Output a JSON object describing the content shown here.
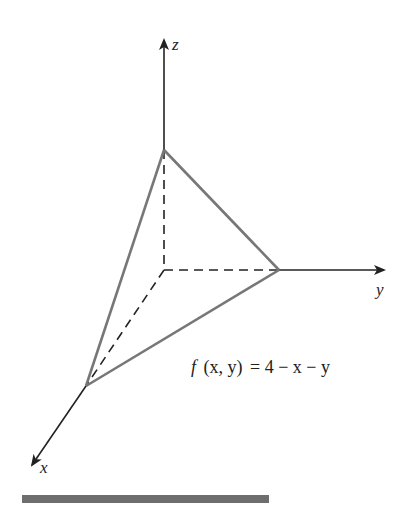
{
  "diagram": {
    "type": "3d-plane-octant",
    "axes": {
      "x_label": "x",
      "y_label": "y",
      "z_label": "z"
    },
    "formula": {
      "f": "f",
      "args": "(x, y)",
      "equals": "= 4 − x − y",
      "full": "f(x, y) = 4 − x − y"
    },
    "vertices": {
      "origin": [
        164,
        270
      ],
      "z_intercept": [
        164,
        150
      ],
      "y_intercept": [
        279,
        270
      ],
      "x_intercept": [
        86,
        386
      ]
    },
    "colors": {
      "axis": "#222222",
      "plane_edge": "#777777",
      "bar": "#6e6e6e"
    }
  }
}
